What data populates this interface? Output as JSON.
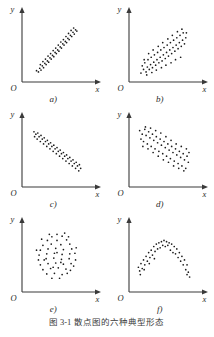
{
  "figure": {
    "caption_number": "图 3-1",
    "caption_text": "散点图的六种典型形态",
    "axis_x_label": "x",
    "axis_y_label": "y",
    "origin_label": "O"
  },
  "panels": [
    {
      "key": "a",
      "label": "a)",
      "pattern": "strong-positive-linear"
    },
    {
      "key": "b",
      "label": "b)",
      "pattern": "moderate-positive-linear"
    },
    {
      "key": "c",
      "label": "c)",
      "pattern": "strong-negative-linear"
    },
    {
      "key": "d",
      "label": "d)",
      "pattern": "moderate-negative-linear"
    },
    {
      "key": "e",
      "label": "e)",
      "pattern": "no-correlation-circular"
    },
    {
      "key": "f",
      "label": "f)",
      "pattern": "nonlinear-inverted-u"
    }
  ],
  "chart_data": [
    {
      "type": "scatter",
      "panel": "a)",
      "title": "",
      "xlabel": "x",
      "ylabel": "y",
      "xlim": [
        0,
        100
      ],
      "ylim": [
        0,
        100
      ],
      "grid": false,
      "description": "strong positive linear correlation, tight narrow band",
      "points": [
        [
          18,
          12
        ],
        [
          21,
          10
        ],
        [
          23,
          16
        ],
        [
          25,
          13
        ],
        [
          27,
          20
        ],
        [
          24,
          22
        ],
        [
          29,
          17
        ],
        [
          31,
          24
        ],
        [
          28,
          27
        ],
        [
          33,
          22
        ],
        [
          35,
          28
        ],
        [
          32,
          31
        ],
        [
          37,
          26
        ],
        [
          39,
          33
        ],
        [
          36,
          36
        ],
        [
          41,
          31
        ],
        [
          43,
          37
        ],
        [
          40,
          40
        ],
        [
          45,
          35
        ],
        [
          47,
          42
        ],
        [
          44,
          45
        ],
        [
          49,
          40
        ],
        [
          51,
          46
        ],
        [
          48,
          49
        ],
        [
          53,
          44
        ],
        [
          55,
          51
        ],
        [
          52,
          54
        ],
        [
          57,
          49
        ],
        [
          59,
          56
        ],
        [
          56,
          59
        ],
        [
          61,
          54
        ],
        [
          63,
          60
        ],
        [
          60,
          63
        ],
        [
          65,
          58
        ],
        [
          67,
          65
        ],
        [
          64,
          68
        ],
        [
          69,
          63
        ],
        [
          71,
          70
        ],
        [
          68,
          73
        ],
        [
          73,
          68
        ],
        [
          75,
          75
        ],
        [
          72,
          78
        ],
        [
          77,
          72
        ],
        [
          79,
          79
        ],
        [
          76,
          82
        ],
        [
          81,
          77
        ]
      ]
    },
    {
      "type": "scatter",
      "panel": "b)",
      "title": "",
      "xlabel": "x",
      "ylabel": "y",
      "xlim": [
        0,
        100
      ],
      "ylim": [
        0,
        100
      ],
      "grid": false,
      "description": "moderate positive linear correlation, wide scattered band",
      "points": [
        [
          14,
          8
        ],
        [
          18,
          14
        ],
        [
          16,
          20
        ],
        [
          22,
          10
        ],
        [
          24,
          18
        ],
        [
          20,
          25
        ],
        [
          27,
          14
        ],
        [
          29,
          22
        ],
        [
          25,
          30
        ],
        [
          32,
          17
        ],
        [
          34,
          26
        ],
        [
          30,
          34
        ],
        [
          37,
          21
        ],
        [
          39,
          30
        ],
        [
          35,
          38
        ],
        [
          42,
          25
        ],
        [
          44,
          34
        ],
        [
          40,
          42
        ],
        [
          47,
          28
        ],
        [
          49,
          38
        ],
        [
          45,
          46
        ],
        [
          52,
          32
        ],
        [
          54,
          42
        ],
        [
          50,
          50
        ],
        [
          57,
          36
        ],
        [
          59,
          46
        ],
        [
          55,
          54
        ],
        [
          62,
          40
        ],
        [
          64,
          50
        ],
        [
          60,
          58
        ],
        [
          67,
          44
        ],
        [
          69,
          54
        ],
        [
          65,
          62
        ],
        [
          72,
          48
        ],
        [
          74,
          58
        ],
        [
          70,
          66
        ],
        [
          77,
          52
        ],
        [
          79,
          62
        ],
        [
          75,
          70
        ],
        [
          82,
          56
        ],
        [
          84,
          66
        ],
        [
          80,
          74
        ],
        [
          19,
          30
        ],
        [
          26,
          40
        ],
        [
          33,
          46
        ],
        [
          41,
          52
        ],
        [
          48,
          58
        ],
        [
          56,
          64
        ],
        [
          63,
          70
        ],
        [
          71,
          76
        ],
        [
          78,
          80
        ],
        [
          85,
          74
        ],
        [
          23,
          5
        ],
        [
          31,
          9
        ],
        [
          38,
          13
        ],
        [
          46,
          17
        ],
        [
          53,
          21
        ],
        [
          61,
          25
        ],
        [
          68,
          30
        ],
        [
          76,
          34
        ]
      ]
    },
    {
      "type": "scatter",
      "panel": "c)",
      "title": "",
      "xlabel": "x",
      "ylabel": "y",
      "xlim": [
        0,
        100
      ],
      "ylim": [
        0,
        100
      ],
      "grid": false,
      "description": "strong negative linear correlation, tight narrow band",
      "points": [
        [
          14,
          84
        ],
        [
          17,
          80
        ],
        [
          15,
          76
        ],
        [
          20,
          82
        ],
        [
          22,
          76
        ],
        [
          19,
          72
        ],
        [
          25,
          78
        ],
        [
          27,
          72
        ],
        [
          24,
          68
        ],
        [
          30,
          74
        ],
        [
          32,
          68
        ],
        [
          29,
          64
        ],
        [
          35,
          70
        ],
        [
          37,
          64
        ],
        [
          34,
          60
        ],
        [
          40,
          66
        ],
        [
          42,
          60
        ],
        [
          39,
          56
        ],
        [
          45,
          62
        ],
        [
          47,
          56
        ],
        [
          44,
          52
        ],
        [
          50,
          58
        ],
        [
          52,
          52
        ],
        [
          49,
          48
        ],
        [
          55,
          54
        ],
        [
          57,
          48
        ],
        [
          54,
          44
        ],
        [
          60,
          50
        ],
        [
          62,
          44
        ],
        [
          59,
          40
        ],
        [
          65,
          46
        ],
        [
          67,
          40
        ],
        [
          64,
          36
        ],
        [
          70,
          42
        ],
        [
          72,
          36
        ],
        [
          69,
          32
        ],
        [
          75,
          38
        ],
        [
          77,
          32
        ],
        [
          74,
          28
        ],
        [
          80,
          34
        ],
        [
          82,
          28
        ],
        [
          79,
          24
        ],
        [
          85,
          30
        ],
        [
          87,
          24
        ],
        [
          84,
          20
        ]
      ]
    },
    {
      "type": "scatter",
      "panel": "d)",
      "title": "",
      "xlabel": "x",
      "ylabel": "y",
      "xlim": [
        0,
        100
      ],
      "ylim": [
        0,
        100
      ],
      "grid": false,
      "description": "moderate negative linear correlation, wide scattered band",
      "points": [
        [
          12,
          86
        ],
        [
          16,
          80
        ],
        [
          14,
          72
        ],
        [
          20,
          88
        ],
        [
          22,
          78
        ],
        [
          18,
          68
        ],
        [
          26,
          84
        ],
        [
          28,
          74
        ],
        [
          24,
          64
        ],
        [
          32,
          80
        ],
        [
          34,
          70
        ],
        [
          30,
          60
        ],
        [
          38,
          76
        ],
        [
          40,
          66
        ],
        [
          36,
          56
        ],
        [
          44,
          72
        ],
        [
          46,
          62
        ],
        [
          42,
          52
        ],
        [
          50,
          68
        ],
        [
          52,
          58
        ],
        [
          48,
          48
        ],
        [
          56,
          64
        ],
        [
          58,
          54
        ],
        [
          54,
          44
        ],
        [
          62,
          60
        ],
        [
          64,
          50
        ],
        [
          60,
          40
        ],
        [
          68,
          56
        ],
        [
          70,
          46
        ],
        [
          66,
          36
        ],
        [
          74,
          52
        ],
        [
          76,
          42
        ],
        [
          72,
          32
        ],
        [
          80,
          48
        ],
        [
          82,
          38
        ],
        [
          78,
          28
        ],
        [
          86,
          44
        ],
        [
          88,
          34
        ],
        [
          84,
          24
        ],
        [
          17,
          60
        ],
        [
          25,
          56
        ],
        [
          33,
          50
        ],
        [
          41,
          44
        ],
        [
          49,
          38
        ],
        [
          57,
          34
        ],
        [
          65,
          28
        ],
        [
          73,
          24
        ],
        [
          81,
          20
        ],
        [
          21,
          92
        ],
        [
          29,
          90
        ],
        [
          37,
          86
        ],
        [
          45,
          82
        ],
        [
          53,
          76
        ],
        [
          61,
          70
        ],
        [
          69,
          64
        ],
        [
          77,
          60
        ],
        [
          85,
          56
        ],
        [
          89,
          50
        ]
      ]
    },
    {
      "type": "scatter",
      "panel": "e)",
      "title": "",
      "xlabel": "x",
      "ylabel": "y",
      "xlim": [
        0,
        100
      ],
      "ylim": [
        0,
        100
      ],
      "grid": false,
      "description": "no correlation, roughly circular cloud of points",
      "points": [
        [
          50,
          88
        ],
        [
          42,
          84
        ],
        [
          58,
          85
        ],
        [
          35,
          78
        ],
        [
          50,
          78
        ],
        [
          65,
          79
        ],
        [
          28,
          70
        ],
        [
          41,
          72
        ],
        [
          56,
          71
        ],
        [
          70,
          72
        ],
        [
          24,
          62
        ],
        [
          36,
          64
        ],
        [
          48,
          65
        ],
        [
          60,
          63
        ],
        [
          73,
          64
        ],
        [
          22,
          54
        ],
        [
          34,
          56
        ],
        [
          46,
          57
        ],
        [
          58,
          55
        ],
        [
          70,
          56
        ],
        [
          78,
          57
        ],
        [
          21,
          46
        ],
        [
          33,
          48
        ],
        [
          45,
          49
        ],
        [
          57,
          47
        ],
        [
          69,
          48
        ],
        [
          79,
          46
        ],
        [
          24,
          38
        ],
        [
          36,
          40
        ],
        [
          48,
          41
        ],
        [
          60,
          39
        ],
        [
          72,
          40
        ],
        [
          76,
          36
        ],
        [
          28,
          30
        ],
        [
          40,
          32
        ],
        [
          52,
          33
        ],
        [
          64,
          31
        ],
        [
          71,
          29
        ],
        [
          34,
          23
        ],
        [
          46,
          24
        ],
        [
          58,
          22
        ],
        [
          66,
          24
        ],
        [
          42,
          16
        ],
        [
          54,
          16
        ],
        [
          30,
          46
        ],
        [
          50,
          58
        ],
        [
          38,
          88
        ],
        [
          62,
          90
        ],
        [
          26,
          80
        ],
        [
          68,
          84
        ],
        [
          80,
          66
        ],
        [
          18,
          62
        ],
        [
          44,
          34
        ],
        [
          56,
          42
        ]
      ]
    },
    {
      "type": "scatter",
      "panel": "f)",
      "title": "",
      "xlabel": "x",
      "ylabel": "y",
      "xlim": [
        0,
        100
      ],
      "ylim": [
        0,
        100
      ],
      "grid": false,
      "description": "nonlinear relationship, inverted U (arch) shape",
      "points": [
        [
          10,
          34
        ],
        [
          14,
          40
        ],
        [
          12,
          28
        ],
        [
          18,
          46
        ],
        [
          22,
          52
        ],
        [
          20,
          38
        ],
        [
          26,
          58
        ],
        [
          30,
          62
        ],
        [
          28,
          50
        ],
        [
          34,
          68
        ],
        [
          38,
          72
        ],
        [
          36,
          60
        ],
        [
          42,
          74
        ],
        [
          46,
          76
        ],
        [
          44,
          66
        ],
        [
          50,
          78
        ],
        [
          54,
          76
        ],
        [
          52,
          68
        ],
        [
          58,
          74
        ],
        [
          62,
          72
        ],
        [
          60,
          62
        ],
        [
          66,
          68
        ],
        [
          70,
          64
        ],
        [
          68,
          56
        ],
        [
          74,
          58
        ],
        [
          78,
          52
        ],
        [
          76,
          44
        ],
        [
          82,
          46
        ],
        [
          86,
          38
        ],
        [
          84,
          30
        ],
        [
          88,
          26
        ],
        [
          90,
          18
        ],
        [
          16,
          32
        ],
        [
          24,
          44
        ],
        [
          32,
          54
        ],
        [
          40,
          64
        ],
        [
          48,
          70
        ],
        [
          56,
          70
        ],
        [
          64,
          58
        ],
        [
          72,
          50
        ],
        [
          80,
          38
        ],
        [
          86,
          22
        ],
        [
          13,
          22
        ],
        [
          19,
          30
        ],
        [
          27,
          40
        ],
        [
          35,
          48
        ]
      ]
    }
  ]
}
